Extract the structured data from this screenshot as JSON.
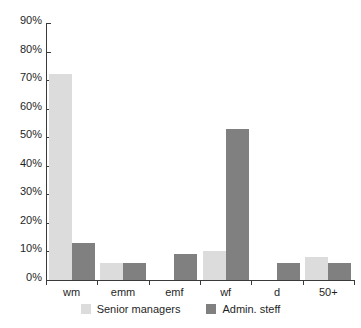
{
  "chart_data": {
    "type": "bar",
    "title": "",
    "subtitle": "",
    "xlabel": "",
    "ylabel": "",
    "categories": [
      "wm",
      "emm",
      "emf",
      "wf",
      "d",
      "50+"
    ],
    "series": [
      {
        "name": "Senior managers",
        "color": "#dcdcdc",
        "values": [
          72,
          6,
          0,
          10,
          0,
          8
        ]
      },
      {
        "name": "Admin. steff",
        "color": "#808080",
        "values": [
          13,
          6,
          9,
          53,
          6,
          6
        ]
      }
    ],
    "ylim": [
      0,
      90
    ],
    "ytick_values": [
      0,
      10,
      20,
      30,
      40,
      50,
      60,
      70,
      80,
      90
    ],
    "ytick_labels": [
      "0%",
      "10%",
      "20%",
      "30%",
      "40%",
      "50%",
      "60%",
      "70%",
      "80%",
      "90%"
    ],
    "grid": false,
    "legend_position": "bottom",
    "legend_entries": [
      "Senior managers",
      "Admin. steff"
    ],
    "axis_color": "#3a3a3a",
    "background_color": "#ffffff"
  }
}
